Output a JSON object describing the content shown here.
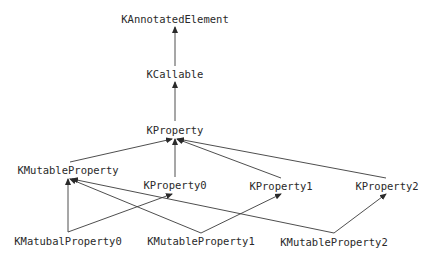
{
  "diagram": {
    "type": "class-hierarchy",
    "colors": {
      "text": "#2a2a2a",
      "edge": "#3a3a3a",
      "background": "#ffffff"
    },
    "nodes": [
      {
        "id": "KAnnotatedElement",
        "label": "KAnnotatedElement",
        "x": 175,
        "y": 19
      },
      {
        "id": "KCallable",
        "label": "KCallable",
        "x": 175,
        "y": 74
      },
      {
        "id": "KProperty",
        "label": "KProperty",
        "x": 175,
        "y": 130
      },
      {
        "id": "KMutableProperty",
        "label": "KMutableProperty",
        "x": 68,
        "y": 170
      },
      {
        "id": "KProperty0",
        "label": "KProperty0",
        "x": 175,
        "y": 185
      },
      {
        "id": "KProperty1",
        "label": "KProperty1",
        "x": 281,
        "y": 186
      },
      {
        "id": "KProperty2",
        "label": "KProperty2",
        "x": 387,
        "y": 186
      },
      {
        "id": "KMatubalProperty0",
        "label": "KMatubalProperty0",
        "x": 68,
        "y": 241
      },
      {
        "id": "KMutableProperty1",
        "label": "KMutableProperty1",
        "x": 201,
        "y": 241
      },
      {
        "id": "KMutableProperty2",
        "label": "KMutableProperty2",
        "x": 334,
        "y": 242
      }
    ],
    "edges": [
      {
        "from": "KCallable",
        "to": "KAnnotatedElement",
        "x1": 175,
        "y1": 66,
        "x2": 175,
        "y2": 27
      },
      {
        "from": "KProperty",
        "to": "KCallable",
        "x1": 175,
        "y1": 121,
        "x2": 175,
        "y2": 82
      },
      {
        "from": "KMutableProperty",
        "to": "KProperty",
        "x1": 70,
        "y1": 162,
        "x2": 172,
        "y2": 139
      },
      {
        "from": "KProperty0",
        "to": "KProperty",
        "x1": 175,
        "y1": 177,
        "x2": 175,
        "y2": 139
      },
      {
        "from": "KProperty1",
        "to": "KProperty",
        "x1": 281,
        "y1": 178,
        "x2": 177,
        "y2": 139
      },
      {
        "from": "KProperty2",
        "to": "KProperty",
        "x1": 386,
        "y1": 178,
        "x2": 178,
        "y2": 139
      },
      {
        "from": "KMatubalProperty0",
        "to": "KMutableProperty",
        "x1": 68,
        "y1": 232,
        "x2": 68,
        "y2": 179
      },
      {
        "from": "KMatubalProperty0",
        "to": "KProperty0",
        "x1": 68,
        "y1": 232,
        "x2": 172,
        "y2": 194
      },
      {
        "from": "KMutableProperty1",
        "to": "KMutableProperty",
        "x1": 201,
        "y1": 233,
        "x2": 70,
        "y2": 179
      },
      {
        "from": "KMutableProperty1",
        "to": "KProperty1",
        "x1": 201,
        "y1": 233,
        "x2": 281,
        "y2": 194
      },
      {
        "from": "KMutableProperty2",
        "to": "KMutableProperty",
        "x1": 334,
        "y1": 233,
        "x2": 72,
        "y2": 179
      },
      {
        "from": "KMutableProperty2",
        "to": "KProperty2",
        "x1": 334,
        "y1": 233,
        "x2": 386,
        "y2": 194
      }
    ]
  }
}
